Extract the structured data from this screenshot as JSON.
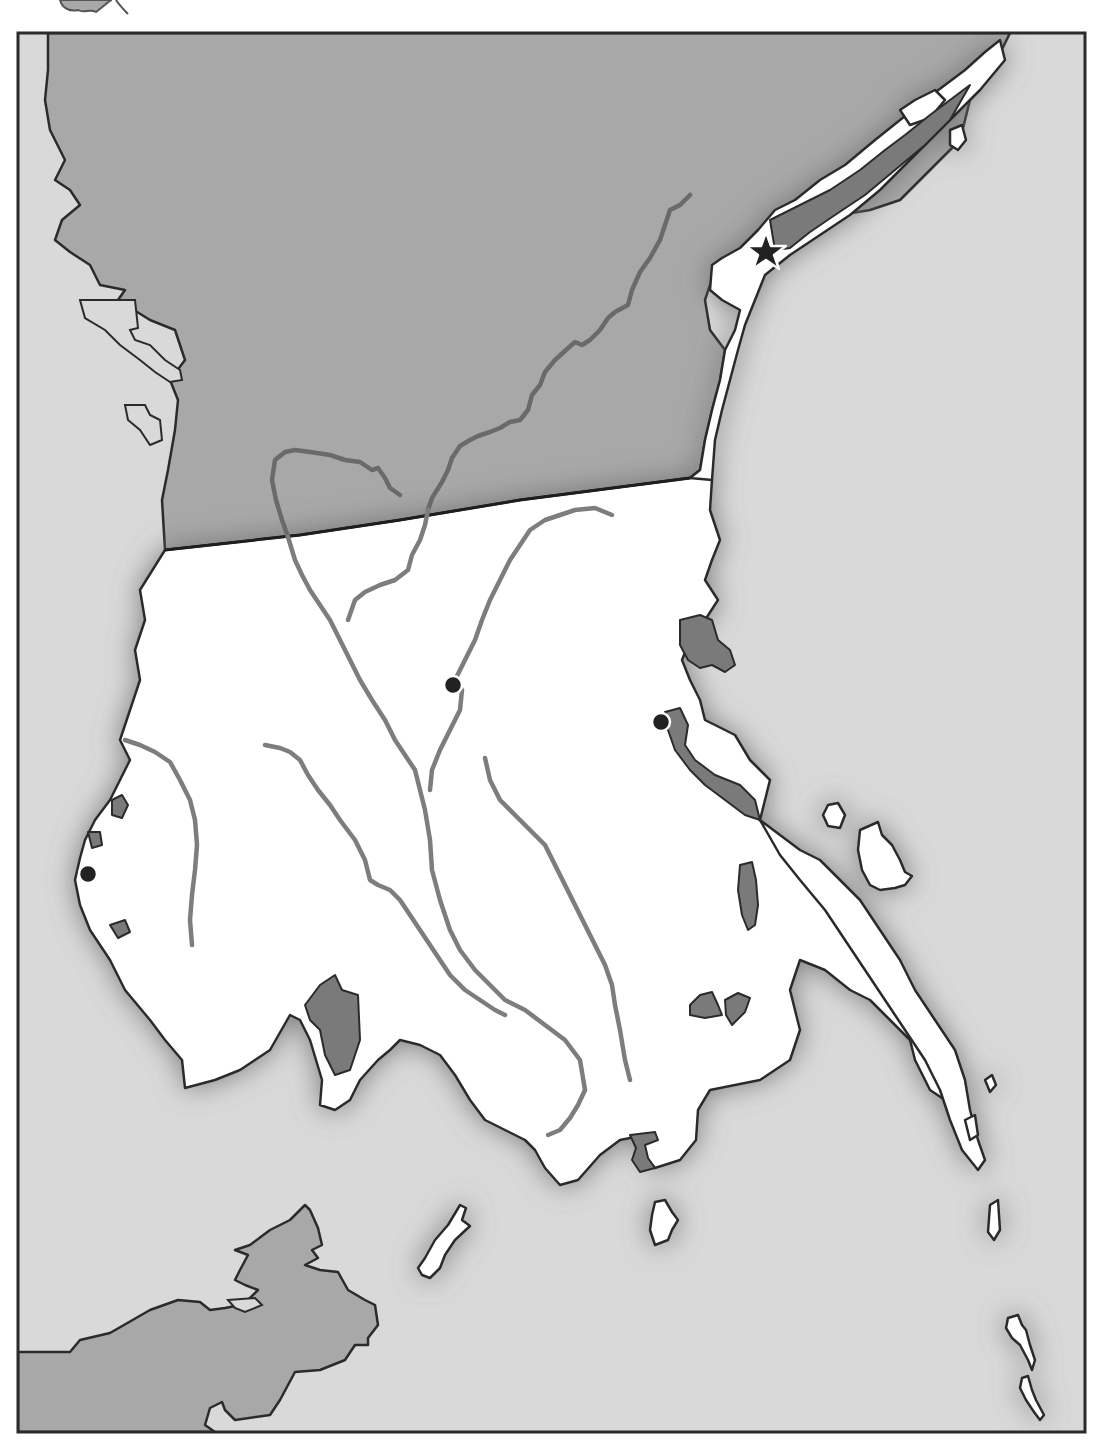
{
  "map": {
    "type": "blank-outline-map",
    "frame": {
      "x": 18,
      "y": 33,
      "width": 1067,
      "height": 1399
    },
    "colors": {
      "sea": "#d9d9d9",
      "neighboring_land": "#a8a8a8",
      "highlighted_country": "#ffffff",
      "inland_water": "#7a7a7a",
      "river": "#7d7d7d",
      "outline": "#2b2b2b",
      "marker": "#222222"
    },
    "features": {
      "neighbor_north": "neighboring-country-north",
      "neighbor_south": "neighboring-landmass-southwest",
      "mainland": "highlighted-country-mainland",
      "northeast_peninsula": "northeast-coastal-strip",
      "southeast_peninsula": "southeast-peninsula",
      "islands": [
        "offshore-island-south",
        "offshore-island-southeast",
        "island-group-east",
        "island-chain-far-southeast"
      ]
    },
    "markers": [
      {
        "id": "capital",
        "kind": "star",
        "x": 766,
        "y": 252
      },
      {
        "id": "city-central",
        "kind": "dot",
        "x": 453,
        "y": 685
      },
      {
        "id": "city-east-coast",
        "kind": "dot",
        "x": 661,
        "y": 722
      },
      {
        "id": "city-west-coast",
        "kind": "dot",
        "x": 88,
        "y": 874
      }
    ],
    "rivers_count": 7,
    "labels": []
  }
}
